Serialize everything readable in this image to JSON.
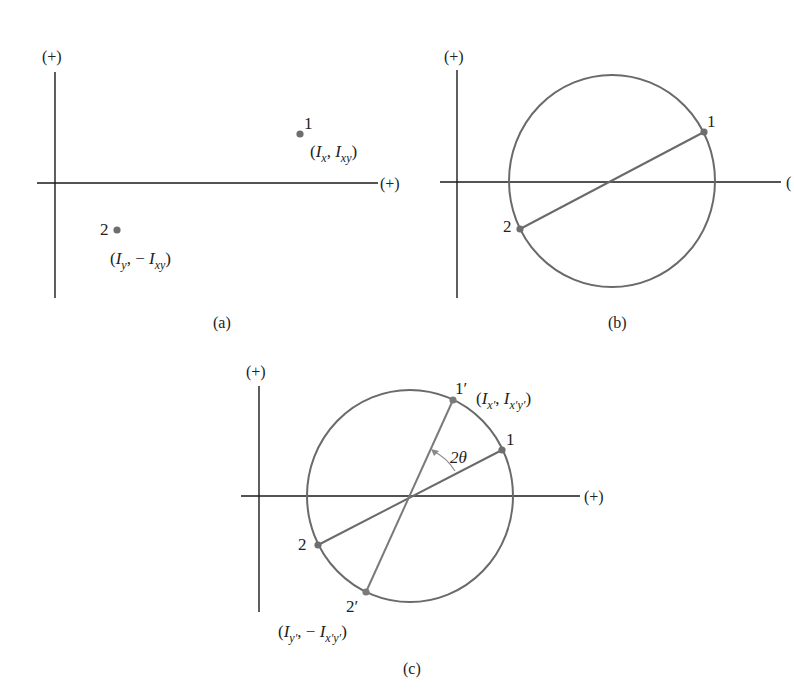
{
  "figure": {
    "colors": {
      "axis": "#1a1a1a",
      "circle": "#6a6a6a",
      "point": "#6e6e6e",
      "text": "#222222",
      "arc": "#8a8a8a"
    },
    "panels": [
      {
        "id": "a",
        "caption": "(a)",
        "y_axis_label": "(+)",
        "x_axis_label": "(+)",
        "points": [
          {
            "name": "1",
            "coords_label": "(I_x, I_xy)"
          },
          {
            "name": "2",
            "coords_label": "(I_y, −I_xy)"
          }
        ]
      },
      {
        "id": "b",
        "caption": "(b)",
        "y_axis_label": "(+)",
        "x_axis_label": "(",
        "points": [
          {
            "name": "1"
          },
          {
            "name": "2"
          }
        ]
      },
      {
        "id": "c",
        "caption": "(c)",
        "y_axis_label": "(+)",
        "x_axis_label": "(+)",
        "angle_label": "2θ",
        "points": [
          {
            "name": "1"
          },
          {
            "name": "2"
          },
          {
            "name": "1′",
            "coords_label": "(I_x′, I_x′y′)"
          },
          {
            "name": "2′",
            "coords_label": "(I_y′, −I_x′y′)"
          }
        ]
      }
    ]
  },
  "text": {
    "a_caption": "(a)",
    "a_yplus": "(+)",
    "a_xplus": "(+)",
    "a_p1": "1",
    "a_p2": "2",
    "a_p1_open": "(",
    "a_p1_I1": "I",
    "a_p1_sub1": "x",
    "a_p1_comma": ", ",
    "a_p1_I2": "I",
    "a_p1_sub2": "xy",
    "a_p1_close": ")",
    "a_p2_open": "(",
    "a_p2_I1": "I",
    "a_p2_sub1": "y",
    "a_p2_comma": ", − ",
    "a_p2_I2": "I",
    "a_p2_sub2": "xy",
    "a_p2_close": ")",
    "b_caption": "(b)",
    "b_yplus": "(+)",
    "b_xplus": "(",
    "b_p1": "1",
    "b_p2": "2",
    "c_caption": "(c)",
    "c_yplus": "(+)",
    "c_xplus": "(+)",
    "c_p1": "1",
    "c_p2": "2",
    "c_p1p": "1′",
    "c_p2p": "2′",
    "c_angle": "2θ",
    "c_p1p_open": "(",
    "c_p1p_I1": "I",
    "c_p1p_sub1": "x′",
    "c_p1p_comma": ", ",
    "c_p1p_I2": "I",
    "c_p1p_sub2": "x′y′",
    "c_p1p_close": ")",
    "c_p2p_open": "(",
    "c_p2p_I1": "I",
    "c_p2p_sub1": "y′",
    "c_p2p_comma": ", − ",
    "c_p2p_I2": "I",
    "c_p2p_sub2": "x′y′",
    "c_p2p_close": ")"
  }
}
